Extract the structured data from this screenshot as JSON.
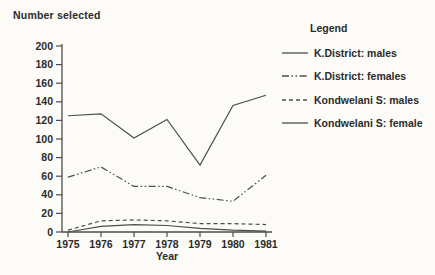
{
  "colors": {
    "background": "#fcfbf8",
    "line": "#4d4d4d",
    "text": "#2b2b2b"
  },
  "chart": {
    "ylabel_title": "Number selected",
    "xlabel": "Year",
    "legend_title": "Legend"
  },
  "chart_data": {
    "type": "line",
    "title": "Number selected",
    "xlabel": "Year",
    "ylabel": "Number selected",
    "x": [
      1975,
      1976,
      1977,
      1978,
      1979,
      1980,
      1981
    ],
    "ylim": [
      0,
      200
    ],
    "ytick_step": 20,
    "grid": false,
    "legend_position": "right",
    "series": [
      {
        "name": "K.District: males",
        "dash": "solid",
        "values": [
          125,
          127,
          101,
          121,
          72,
          136,
          147
        ]
      },
      {
        "name": "K.District: females",
        "dash": "dashdot",
        "values": [
          59,
          70,
          49,
          49,
          37,
          33,
          61
        ]
      },
      {
        "name": "Kondwelani S: males",
        "dash": "dashed",
        "values": [
          2,
          12,
          13,
          12,
          9,
          9,
          8
        ]
      },
      {
        "name": "Kondwelani S: female",
        "dash": "solid",
        "values": [
          0,
          6,
          8,
          7,
          4,
          2,
          1
        ]
      }
    ]
  }
}
